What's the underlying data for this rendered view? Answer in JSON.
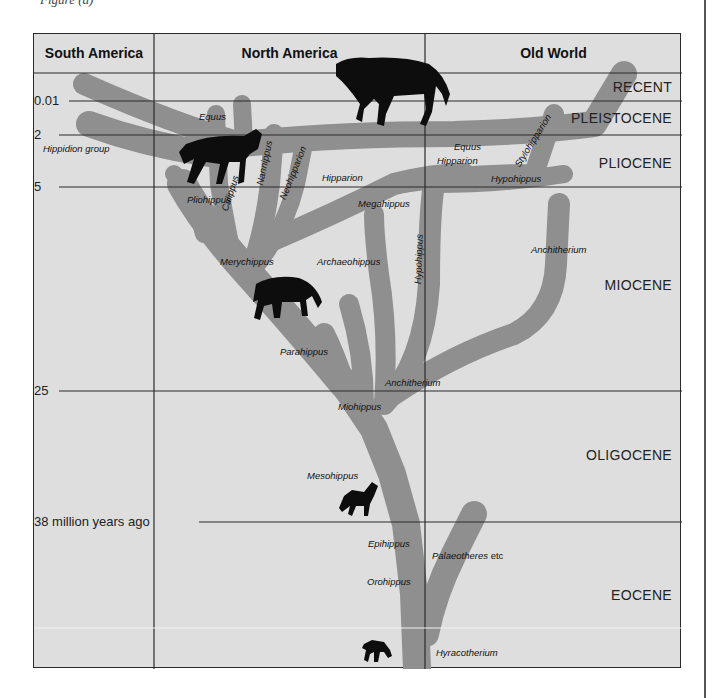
{
  "caption": "Figure (a)",
  "columns": [
    {
      "label": "South America"
    },
    {
      "label": "North America"
    },
    {
      "label": "Old World"
    }
  ],
  "time_ticks": [
    {
      "label": "0.01"
    },
    {
      "label": "2"
    },
    {
      "label": "5"
    },
    {
      "label": "25"
    },
    {
      "label": "38 million years ago"
    }
  ],
  "epochs": [
    {
      "label": "RECENT"
    },
    {
      "label": "PLEISTOCENE"
    },
    {
      "label": "PLIOCENE"
    },
    {
      "label": "MIOCENE"
    },
    {
      "label": "OLIGOCENE"
    },
    {
      "label": "EOCENE"
    }
  ],
  "taxa": {
    "equus_na": "Equus",
    "equus_ow": "Equus",
    "hippidion": "Hippidion group",
    "pliohippus": "Pliohippus",
    "calippus": "Calippus",
    "nannippus": "Nannippus",
    "neohipparion": "Neohipparion",
    "hipparion_na": "Hipparion",
    "hipparion_ow": "Hipparion",
    "stylohipparion": "Stylohipparion",
    "hypohippus_ow": "Hypohippus",
    "megahippus": "Megahippus",
    "hypohippus_na": "Hypohippus",
    "merychippus": "Merychippus",
    "archaeohippus": "Archaeohippus",
    "anchitherium_ow": "Anchitherium",
    "parahippus": "Parahippus",
    "anchitherium_na": "Anchitherium",
    "miohippus": "Miohippus",
    "mesohippus": "Mesohippus",
    "epihippus": "Epihippus",
    "palaeotheres": "Palaeotheres",
    "palaeotheres_etc": "etc",
    "orohippus": "Orohippus",
    "hyracotherium": "Hyracotherium"
  },
  "colors": {
    "background": "#dedede",
    "branch": "#8f8f8f",
    "lines": "#2a2a2a",
    "silhouette": "#0d0d0d"
  }
}
